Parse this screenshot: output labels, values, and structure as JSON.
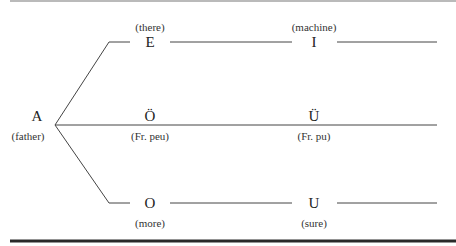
{
  "diagram": {
    "root": {
      "vowel": "A",
      "gloss": "(father)"
    },
    "rows": [
      {
        "name": "front",
        "nodes": [
          {
            "vowel": "E",
            "gloss": "(there)"
          },
          {
            "vowel": "I",
            "gloss": "(machine)"
          }
        ]
      },
      {
        "name": "mixed",
        "nodes": [
          {
            "vowel": "Ö",
            "gloss": "(Fr. peu)"
          },
          {
            "vowel": "Ü",
            "gloss": "(Fr. pu)"
          }
        ]
      },
      {
        "name": "back",
        "nodes": [
          {
            "vowel": "O",
            "gloss": "(more)"
          },
          {
            "vowel": "U",
            "gloss": "(sure)"
          }
        ]
      }
    ],
    "colors": {
      "line": "#333333",
      "rule": "#2a2a2a"
    }
  }
}
